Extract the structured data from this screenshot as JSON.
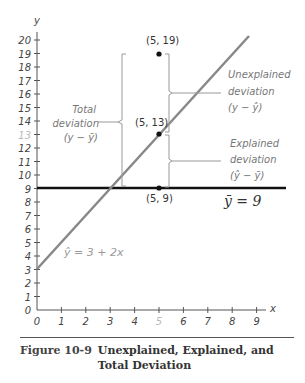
{
  "chart_data": {
    "type": "scatter",
    "title": "Unexplained, Explained, and Total Deviation",
    "xlabel": "x",
    "ylabel": "y",
    "xlim": [
      0,
      9
    ],
    "ylim": [
      0,
      20
    ],
    "x_ticks": [
      "0",
      "1",
      "2",
      "3",
      "4",
      "5",
      "6",
      "7",
      "8",
      "9"
    ],
    "y_ticks": [
      "0",
      "1",
      "2",
      "3",
      "4",
      "5",
      "6",
      "7",
      "8",
      "9",
      "10",
      "11",
      "12",
      "13",
      "14",
      "15",
      "16",
      "17",
      "18",
      "19",
      "20"
    ],
    "grid": false,
    "series": [
      {
        "name": "points",
        "type": "scatter",
        "x": [
          5,
          5,
          5
        ],
        "y": [
          19,
          13,
          9
        ]
      },
      {
        "name": "regression line",
        "type": "line",
        "equation": "ŷ = 3 + 2x",
        "intercept": 3,
        "slope": 2
      },
      {
        "name": "mean line",
        "type": "line",
        "equation": "ȳ = 9",
        "y": 9
      }
    ],
    "point_labels": [
      "(5, 19)",
      "(5, 13)",
      "(5, 9)"
    ],
    "annotations": [
      {
        "text": "Total deviation (y − ȳ)",
        "from": 9,
        "to": 19
      },
      {
        "text": "Unexplained deviation (y − ŷ)",
        "from": 13,
        "to": 19
      },
      {
        "text": "Explained deviation (ŷ − ȳ)",
        "from": 9,
        "to": 13
      }
    ]
  },
  "labels": {
    "y_axis": "y",
    "x_axis": "x",
    "p19": "(5, 19)",
    "p13": "(5, 13)",
    "p9": "(5, 9)",
    "total_1": "Total",
    "total_2": "deviation",
    "total_3": "(y − ȳ)",
    "unexp_1": "Unexplained",
    "unexp_2": "deviation",
    "unexp_3": "(y − ŷ)",
    "exp_1": "Explained",
    "exp_2": "deviation",
    "exp_3": "(ŷ − ȳ)",
    "mean_eq": "ȳ = 9",
    "reg_eq": "ŷ = 3 + 2x"
  },
  "caption": {
    "number": "Figure 10-9",
    "title": "Unexplained, Explained, and Total Deviation"
  },
  "colors": {
    "regression_line": "#888888",
    "mean_line": "#111111",
    "axis": "#444444",
    "bracket": "#999999"
  }
}
